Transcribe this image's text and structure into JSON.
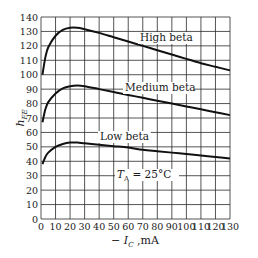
{
  "chart_data": {
    "type": "line",
    "title": "",
    "xlabel": "− I_C ,mA",
    "xlabel_main": "− I",
    "xlabel_sub": "C",
    "xlabel_unit": " ,mA",
    "ylabel": "h_FE",
    "ylabel_main": "h",
    "ylabel_sub": "FE",
    "xlim": [
      0,
      130
    ],
    "ylim": [
      0,
      140
    ],
    "x_ticks": [
      0,
      10,
      20,
      30,
      40,
      50,
      60,
      70,
      80,
      90,
      100,
      110,
      120,
      130
    ],
    "y_ticks": [
      0,
      10,
      20,
      30,
      40,
      50,
      60,
      70,
      80,
      90,
      100,
      110,
      120,
      130,
      140
    ],
    "grid": true,
    "legend_position": "inline labels",
    "annotation": {
      "main": "T",
      "sub": "A",
      "rest": " = 25°C",
      "text": "T_A = 25°C"
    },
    "x": [
      1,
      3,
      5,
      10,
      15,
      20,
      25,
      30,
      40,
      50,
      60,
      70,
      80,
      90,
      100,
      110,
      120,
      130
    ],
    "series": [
      {
        "name": "High beta",
        "label": "High beta",
        "values": [
          100,
          112,
          119,
          127,
          131,
          132.5,
          132.5,
          131.5,
          129,
          126,
          123,
          120,
          117,
          114,
          111,
          108,
          105.5,
          103
        ]
      },
      {
        "name": "Medium beta",
        "label": "Medium beta",
        "values": [
          67,
          76,
          81,
          87,
          90.5,
          92,
          92.5,
          92,
          90,
          88,
          86,
          84,
          82,
          80,
          78,
          76,
          74,
          72
        ]
      },
      {
        "name": "Low beta",
        "label": "Low beta",
        "values": [
          38,
          43,
          46,
          50,
          52,
          53,
          53,
          52.5,
          51.5,
          50.5,
          49.5,
          48,
          47,
          46,
          45,
          44,
          43,
          42
        ]
      }
    ]
  },
  "colors": {
    "line": "#111111",
    "grid": "#2a2a2a",
    "text": "#1a1a1a",
    "background": "#ffffff"
  }
}
